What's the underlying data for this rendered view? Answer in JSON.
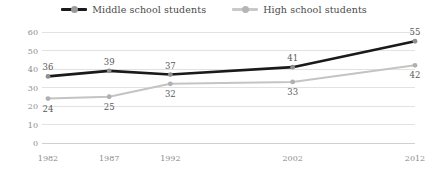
{
  "chart_data": {
    "type": "line",
    "title": "",
    "subtitle": "",
    "xlabel": "",
    "ylabel": "",
    "categories": [
      "1982",
      "1987",
      "1992",
      "2002",
      "2012"
    ],
    "x": [
      1982,
      1987,
      1992,
      2002,
      2012
    ],
    "ylim": [
      0,
      60
    ],
    "yticks": [
      0,
      10,
      20,
      30,
      40,
      50,
      60
    ],
    "grid": "horizontal",
    "legend_position": "top-center",
    "series": [
      {
        "name": "Middle school students",
        "color": "#1a1a1a",
        "marker": "circle",
        "marker_color": "#8f8f8f",
        "values": [
          36,
          39,
          37,
          41,
          55
        ],
        "labels": [
          "36",
          "39",
          "37",
          "41",
          "55"
        ],
        "label_position": "above"
      },
      {
        "name": "High school students",
        "color": "#c4c4c4",
        "marker": "circle",
        "marker_color": "#b0b0b0",
        "values": [
          24,
          25,
          32,
          33,
          42
        ],
        "labels": [
          "24",
          "25",
          "32",
          "33",
          "42"
        ],
        "label_position": "below"
      }
    ]
  },
  "legend": {
    "items": [
      {
        "label": "Middle school students",
        "color": "#1a1a1a",
        "marker_color": "#9a9a9a"
      },
      {
        "label": "High school students",
        "color": "#c9c9c9",
        "marker_color": "#b5b5b5"
      }
    ]
  },
  "axes": {
    "y_tick_labels": [
      "60",
      "50",
      "40",
      "30",
      "20",
      "10",
      "0"
    ],
    "x_tick_labels": [
      "1982",
      "1987",
      "1992",
      "2002",
      "2012"
    ]
  },
  "data_labels": {
    "middle": [
      "36",
      "39",
      "37",
      "41",
      "55"
    ],
    "high": [
      "24",
      "25",
      "32",
      "33",
      "42"
    ]
  },
  "colors": {
    "grid": "#e2e2e2",
    "axis": "#d0d0d0",
    "tick_text": "#8c8c8c",
    "label_text": "#5a5a5a",
    "legend_text": "#4a4a4a",
    "background": "#ffffff"
  }
}
